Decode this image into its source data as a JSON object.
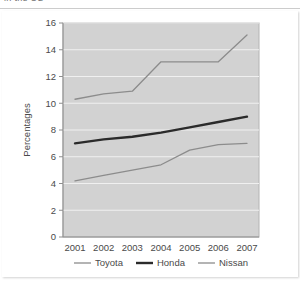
{
  "clipped_header": {
    "text": "in the US"
  },
  "chart_data": {
    "type": "line",
    "title": "",
    "xlabel": "",
    "ylabel": "Percentages",
    "categories": [
      "2001",
      "2002",
      "2003",
      "2004",
      "2005",
      "2006",
      "2007"
    ],
    "x": [
      2001,
      2002,
      2003,
      2004,
      2005,
      2006,
      2007
    ],
    "ylim": [
      0,
      16
    ],
    "yticks": [
      0,
      2,
      4,
      6,
      8,
      10,
      12,
      14,
      16
    ],
    "ytick_labels": [
      "0",
      "2",
      "4",
      "6",
      "8",
      "10",
      "12",
      "14",
      "16"
    ],
    "grid": true,
    "grid_axis": "y",
    "grid_color": "#f0f0f0",
    "plot_background": "#d2d2d2",
    "legend_position": "below",
    "series": [
      {
        "name": "Toyota",
        "values": [
          4.2,
          4.6,
          5.0,
          5.4,
          6.5,
          6.9,
          7.0
        ],
        "color": "#8c8c8c",
        "line_width": 1.3
      },
      {
        "name": "Honda",
        "values": [
          7.0,
          7.3,
          7.5,
          7.8,
          8.2,
          8.6,
          9.0
        ],
        "color": "#2b2b2b",
        "line_width": 2.4
      },
      {
        "name": "Nissan",
        "values": [
          10.3,
          10.7,
          10.9,
          13.1,
          13.1,
          13.1,
          15.1
        ],
        "color": "#8c8c8c",
        "line_width": 1.3
      }
    ]
  },
  "legend": {
    "items": [
      {
        "label": "Toyota",
        "color": "#8c8c8c",
        "line_width": 1.3
      },
      {
        "label": "Honda",
        "color": "#2b2b2b",
        "line_width": 2.4
      },
      {
        "label": "Nissan",
        "color": "#8c8c8c",
        "line_width": 1.3
      }
    ]
  }
}
